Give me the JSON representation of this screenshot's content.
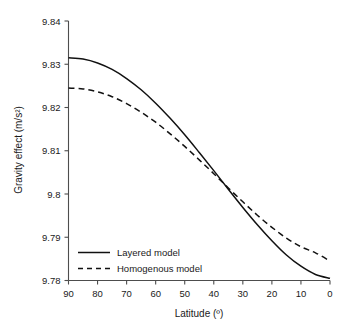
{
  "chart_data": {
    "type": "line",
    "title": "",
    "xlabel": "Latitude (º)",
    "ylabel": "Gravity effect (m/s²)",
    "xlim": [
      90,
      0
    ],
    "ylim": [
      9.78,
      9.84
    ],
    "x_reversed": true,
    "grid": false,
    "legend_position": "lower-left-inside",
    "xticks": [
      90,
      80,
      70,
      60,
      50,
      40,
      30,
      20,
      10,
      0
    ],
    "xtick_labels": [
      "90",
      "80",
      "70",
      "60",
      "50",
      "40",
      "30",
      "20",
      "10",
      "0"
    ],
    "yticks": [
      9.78,
      9.79,
      9.8,
      9.81,
      9.82,
      9.83,
      9.84
    ],
    "ytick_labels": [
      "9.78",
      "9.79",
      "9.8",
      "9.81",
      "9.82",
      "9.83",
      "9.84"
    ],
    "x": [
      90,
      85,
      80,
      75,
      70,
      65,
      60,
      55,
      50,
      45,
      40,
      35,
      30,
      25,
      20,
      15,
      10,
      5,
      0
    ],
    "series": [
      {
        "name": "Layered model",
        "style": "solid",
        "color": "#111111",
        "values": [
          9.8315,
          9.8312,
          9.8303,
          9.8288,
          9.8267,
          9.8241,
          9.821,
          9.8175,
          9.8137,
          9.8096,
          9.8054,
          9.8011,
          9.7969,
          9.7929,
          9.7892,
          9.7859,
          9.7833,
          9.7814,
          9.7805
        ]
      },
      {
        "name": "Homogenous model",
        "style": "dashed",
        "color": "#111111",
        "values": [
          9.8245,
          9.8243,
          9.8236,
          9.8225,
          9.8209,
          9.8189,
          9.8166,
          9.8139,
          9.811,
          9.8079,
          9.8047,
          9.8014,
          9.7982,
          9.7951,
          9.7923,
          9.7898,
          9.7878,
          9.7864,
          9.7845
        ]
      }
    ],
    "crossover": {
      "x": 38,
      "y": 9.799
    },
    "annotations": []
  },
  "legend": {
    "entries": [
      {
        "label": "Layered model",
        "style": "solid"
      },
      {
        "label": "Homogenous model",
        "style": "dashed"
      }
    ]
  }
}
